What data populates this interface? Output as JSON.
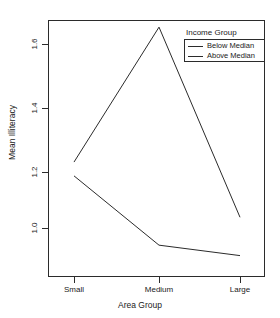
{
  "chart_data": {
    "type": "line",
    "title": "",
    "xlabel": "Area Group",
    "ylabel": "Mean Illiteracy",
    "categories": [
      "Small",
      "Medium",
      "Large"
    ],
    "series": [
      {
        "name": "Below Median",
        "values": [
          1.215,
          1.655,
          1.035
        ]
      },
      {
        "name": "Above Median",
        "values": [
          1.17,
          0.944,
          0.91
        ]
      }
    ],
    "yticks": [
      1.0,
      1.2,
      1.4,
      1.6
    ],
    "ytick_labels": [
      "1.0",
      "1.2",
      "1.4",
      "1.6"
    ],
    "ylim": [
      0.88,
      1.68
    ],
    "grid": false,
    "legend_position": "top-right",
    "legend_title": "Income Group",
    "line_color": "#2b2b2b"
  },
  "axes": {
    "y_title": "Mean Illiteracy",
    "x_title": "Area Group",
    "y_tick_labels": [
      "1.6",
      "1.4",
      "1.2",
      "1.0"
    ],
    "x_tick_labels": [
      "Small",
      "Medium",
      "Large"
    ]
  },
  "legend": {
    "title": "Income Group",
    "entries": [
      {
        "label": "Below Median"
      },
      {
        "label": "Above Median"
      }
    ]
  }
}
